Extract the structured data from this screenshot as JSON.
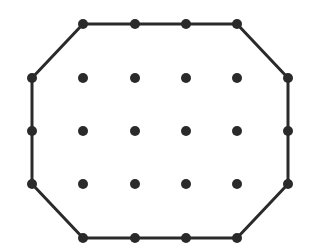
{
  "diagram": {
    "type": "dot-grid-polygon",
    "colors": {
      "background": "#ffffff",
      "ink": "#2a2a2a"
    },
    "grid": {
      "columns": 6,
      "rows": 5,
      "x": [
        32,
        83,
        135,
        186,
        237,
        288
      ],
      "y": [
        24,
        78,
        131,
        184,
        238
      ]
    },
    "dot_radius": 5,
    "stroke_width": 3,
    "polygon": {
      "shape": "octagon",
      "vertices": [
        [
          1,
          0
        ],
        [
          4,
          0
        ],
        [
          5,
          1
        ],
        [
          5,
          3
        ],
        [
          4,
          4
        ],
        [
          1,
          4
        ],
        [
          0,
          3
        ],
        [
          0,
          1
        ]
      ]
    },
    "boundary_dots": [
      [
        1,
        0
      ],
      [
        2,
        0
      ],
      [
        3,
        0
      ],
      [
        4,
        0
      ],
      [
        5,
        1
      ],
      [
        5,
        2
      ],
      [
        5,
        3
      ],
      [
        4,
        4
      ],
      [
        3,
        4
      ],
      [
        2,
        4
      ],
      [
        1,
        4
      ],
      [
        0,
        3
      ],
      [
        0,
        2
      ],
      [
        0,
        1
      ]
    ],
    "interior_dots": [
      [
        1,
        1
      ],
      [
        2,
        1
      ],
      [
        3,
        1
      ],
      [
        4,
        1
      ],
      [
        1,
        2
      ],
      [
        2,
        2
      ],
      [
        3,
        2
      ],
      [
        4,
        2
      ],
      [
        1,
        3
      ],
      [
        2,
        3
      ],
      [
        3,
        3
      ],
      [
        4,
        3
      ]
    ]
  }
}
